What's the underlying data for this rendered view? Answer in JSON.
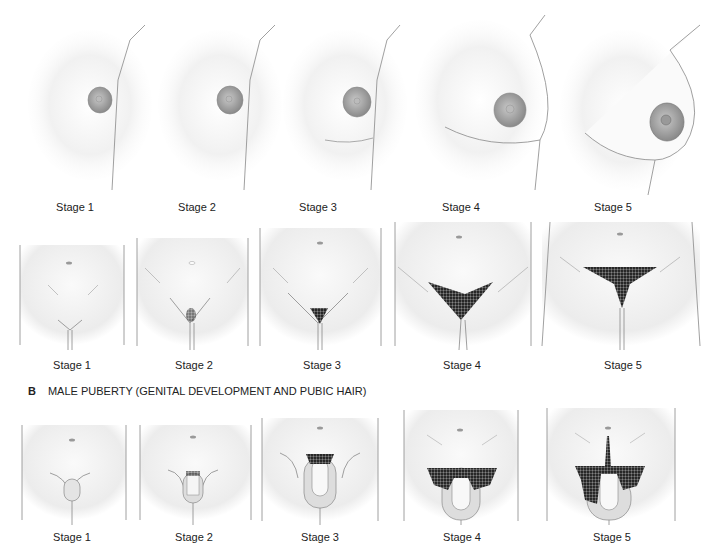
{
  "section_a": {
    "breast_row": {
      "figures": [
        {
          "label": "Stage 1"
        },
        {
          "label": "Stage 2"
        },
        {
          "label": "Stage 3"
        },
        {
          "label": "Stage 4"
        },
        {
          "label": "Stage 5"
        }
      ]
    },
    "pubic_row": {
      "figures": [
        {
          "label": "Stage 1"
        },
        {
          "label": "Stage 2"
        },
        {
          "label": "Stage 3"
        },
        {
          "label": "Stage 4"
        },
        {
          "label": "Stage 5"
        }
      ]
    }
  },
  "section_b": {
    "letter": "B",
    "title": "MALE PUBERTY (GENITAL DEVELOPMENT AND PUBIC HAIR)",
    "figures": [
      {
        "label": "Stage 1"
      },
      {
        "label": "Stage 2"
      },
      {
        "label": "Stage 3"
      },
      {
        "label": "Stage 4"
      },
      {
        "label": "Stage 5"
      }
    ]
  },
  "colors": {
    "skin_shadow": "#d9d9d9",
    "outline": "#888888",
    "areola": "#9a9a9a",
    "hair": "#2a2a2a"
  }
}
